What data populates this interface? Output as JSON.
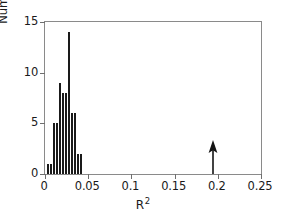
{
  "chart_data": {
    "type": "bar",
    "title": "",
    "subtitle": "",
    "xlabel": "R",
    "xlabel_superscript": "2",
    "ylabel": "Number of cases",
    "xlim": [
      0,
      0.25
    ],
    "ylim": [
      0,
      15
    ],
    "grid": false,
    "legend": null,
    "xticks": [
      0,
      0.05,
      0.1,
      0.15,
      0.2,
      0.25
    ],
    "xtick_labels": [
      "0",
      "0.05",
      "0.1",
      "0.15",
      "0.2",
      "0.25"
    ],
    "yticks": [
      0,
      5,
      10,
      15
    ],
    "ytick_labels": [
      "0",
      "5",
      "10",
      "15"
    ],
    "bin_width": 0.0035,
    "bar_color": "#1a1a1a",
    "bins": [
      {
        "x": 0.0035,
        "value": 1
      },
      {
        "x": 0.007,
        "value": 1
      },
      {
        "x": 0.0105,
        "value": 5
      },
      {
        "x": 0.014,
        "value": 5
      },
      {
        "x": 0.0175,
        "value": 9
      },
      {
        "x": 0.021,
        "value": 8
      },
      {
        "x": 0.0245,
        "value": 8
      },
      {
        "x": 0.028,
        "value": 14
      },
      {
        "x": 0.0315,
        "value": 6
      },
      {
        "x": 0.035,
        "value": 6
      },
      {
        "x": 0.0385,
        "value": 2
      },
      {
        "x": 0.042,
        "value": 2
      }
    ],
    "annotations": [
      {
        "name": "observed-value-arrow",
        "type": "arrow",
        "direction": "up",
        "x": 0.195,
        "y_tail": 0,
        "y_head": 3.4
      }
    ]
  }
}
